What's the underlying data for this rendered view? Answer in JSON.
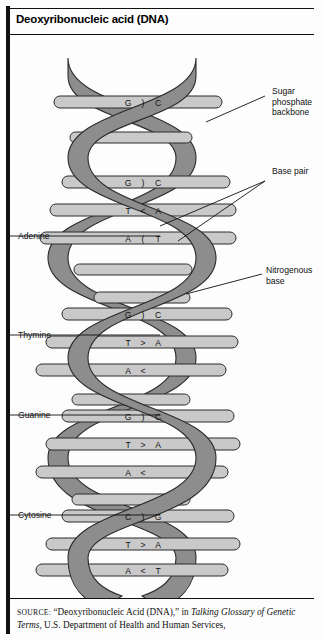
{
  "title": "Deoxyribonucleic acid (DNA)",
  "colors": {
    "backbone": "#8d8d8d",
    "backbone_edge": "#2b2b2b",
    "rung": "#c9c9c9",
    "rung_edge": "#2b2b2b",
    "page": "#fdfdfd",
    "ink": "#111111"
  },
  "labels_right": [
    {
      "name": "sugar-phosphate-backbone",
      "lines": "Sugar\nphosphate\nbackbone"
    },
    {
      "name": "base-pair",
      "lines": "Base pair"
    },
    {
      "name": "nitrogenous-base",
      "lines": "Nitrogenous\nbase"
    }
  ],
  "labels_left": [
    {
      "name": "adenine",
      "text": "Adenine"
    },
    {
      "name": "thymine",
      "text": "Thymine"
    },
    {
      "name": "guanine",
      "text": "Guanine"
    },
    {
      "name": "cytosine",
      "text": "Cytosine"
    }
  ],
  "base_pairs": [
    {
      "left": "G",
      "bond": ")",
      "right": "C"
    },
    {
      "left": "G",
      "bond": ")",
      "right": "C"
    },
    {
      "left": "G",
      "bond": ")",
      "right": "C"
    },
    {
      "left": "T",
      "bond": "<",
      "right": "A"
    },
    {
      "left": "A",
      "bond": "(",
      "right": "T"
    },
    {
      "left": "G",
      "bond": ")",
      "right": "C"
    },
    {
      "left": "T",
      "bond": ">",
      "right": "A"
    },
    {
      "left": "A",
      "bond": "<",
      "right": ""
    },
    {
      "left": "G",
      "bond": ")",
      "right": "C"
    },
    {
      "left": "T",
      "bond": ">",
      "right": "A"
    },
    {
      "left": "A",
      "bond": "<",
      "right": ""
    },
    {
      "left": "C",
      "bond": ")",
      "right": "G"
    },
    {
      "left": "T",
      "bond": ">",
      "right": "A"
    },
    {
      "left": "A",
      "bond": "<",
      "right": "T"
    }
  ],
  "source": {
    "lead": "SOURCE:",
    "part1": " “Deoxyribonucleic Acid (DNA),” in ",
    "italic1": "Talking Glossary of Genetic Terms",
    "part2": ", U.S. Department of Health and Human Services,"
  }
}
